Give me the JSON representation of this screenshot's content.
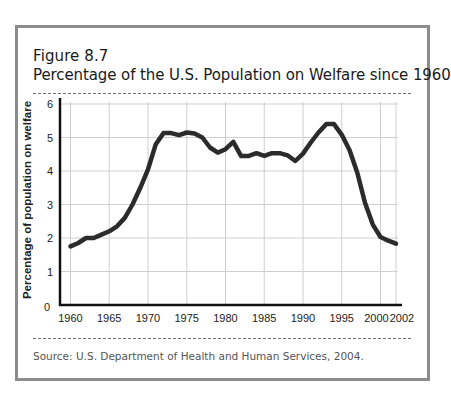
{
  "figure": {
    "number": "Figure 8.7",
    "title": "Percentage of the U.S. Population on Welfare since 1960",
    "source": "Source: U.S. Department of Health and Human Services, 2004."
  },
  "colors": {
    "frame": "#8c8c8c",
    "line": "#2b2b2b",
    "grid": "#cfcfcf",
    "axis": "#111111"
  },
  "chart_data": {
    "type": "line",
    "title": "Percentage of the U.S. Population on Welfare since 1960",
    "xlabel": "",
    "ylabel": "Percentage of population on welfare",
    "xlim": [
      1960,
      2002
    ],
    "ylim": [
      0,
      6
    ],
    "x_ticks": [
      1960,
      1965,
      1970,
      1975,
      1980,
      1985,
      1990,
      1995,
      2000,
      2002
    ],
    "y_ticks": [
      0,
      1,
      2,
      3,
      4,
      5,
      6
    ],
    "grid": true,
    "legend": null,
    "series": [
      {
        "name": "Percentage on welfare",
        "x": [
          1960,
          1961,
          1962,
          1963,
          1964,
          1965,
          1966,
          1967,
          1968,
          1969,
          1970,
          1971,
          1972,
          1973,
          1974,
          1975,
          1976,
          1977,
          1978,
          1979,
          1980,
          1981,
          1982,
          1983,
          1984,
          1985,
          1986,
          1987,
          1988,
          1989,
          1990,
          1991,
          1992,
          1993,
          1994,
          1995,
          1996,
          1997,
          1998,
          1999,
          2000,
          2001,
          2002
        ],
        "values": [
          1.75,
          1.85,
          2.0,
          2.0,
          2.1,
          2.2,
          2.35,
          2.6,
          3.0,
          3.5,
          4.05,
          4.8,
          5.13,
          5.13,
          5.07,
          5.15,
          5.12,
          5.0,
          4.7,
          4.55,
          4.65,
          4.87,
          4.45,
          4.45,
          4.53,
          4.45,
          4.53,
          4.53,
          4.47,
          4.3,
          4.52,
          4.85,
          5.15,
          5.4,
          5.4,
          5.08,
          4.63,
          3.95,
          3.05,
          2.4,
          2.03,
          1.92,
          1.83
        ]
      }
    ]
  }
}
